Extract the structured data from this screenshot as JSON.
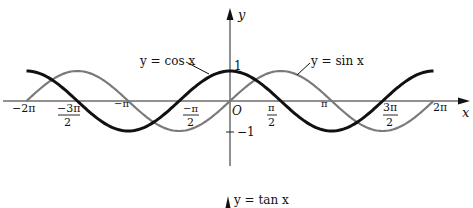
{
  "chart_data": [
    {
      "type": "line",
      "title": "",
      "xlabel": "x",
      "ylabel": "y",
      "xlim": [
        -6.2832,
        6.2832
      ],
      "ylim": [
        -1,
        1
      ],
      "grid": false,
      "x_tick_labels": [
        "−2π",
        "−3π/2",
        "−π",
        "−π/2",
        "O",
        "π/2",
        "π",
        "3π/2",
        "2π"
      ],
      "x_ticks": [
        -6.2832,
        -4.7124,
        -3.1416,
        -1.5708,
        0,
        1.5708,
        3.1416,
        4.7124,
        6.2832
      ],
      "y_tick_labels": [
        "1",
        "−1"
      ],
      "y_ticks": [
        1,
        -1
      ],
      "series": [
        {
          "name": "y = cos x",
          "function": "cos",
          "color": "#111111",
          "stroke": "thick",
          "x": [
            -6.2832,
            -4.7124,
            -3.1416,
            -1.5708,
            0,
            1.5708,
            3.1416,
            4.7124,
            6.2832
          ],
          "values": [
            1,
            0,
            -1,
            0,
            1,
            0,
            -1,
            0,
            1
          ]
        },
        {
          "name": "y = sin x",
          "function": "sin",
          "color": "#777777",
          "stroke": "medium",
          "x": [
            -6.2832,
            -4.7124,
            -3.1416,
            -1.5708,
            0,
            1.5708,
            3.1416,
            4.7124,
            6.2832
          ],
          "values": [
            0,
            1,
            0,
            -1,
            0,
            1,
            0,
            -1,
            0
          ]
        }
      ],
      "annotations": [
        {
          "text": "y = cos x",
          "points_to": "cos curve near x ≈ -0.6"
        },
        {
          "text": "y = sin x",
          "points_to": "sin curve near x ≈ 2.2"
        }
      ]
    },
    {
      "type": "line",
      "title": "",
      "series": [
        {
          "name": "y = tan x",
          "function": "tan"
        }
      ],
      "annotations": [
        {
          "text": "y = tan x"
        }
      ],
      "note": "partially visible at bottom edge"
    }
  ],
  "labels": {
    "x_axis": "x",
    "y_axis": "y",
    "origin": "O",
    "y_one": "1",
    "y_neg_one": "−1",
    "cos_label": "y = cos x",
    "sin_label": "y = sin x",
    "tan_label": "y = tan x",
    "neg_two_pi": "−2π",
    "neg_pi": "−π",
    "pi": "π",
    "two_pi": "2π",
    "neg_three": "−3π",
    "neg_one_pi": "−π",
    "one_pi": "π",
    "three_pi": "3π",
    "two": "2"
  }
}
